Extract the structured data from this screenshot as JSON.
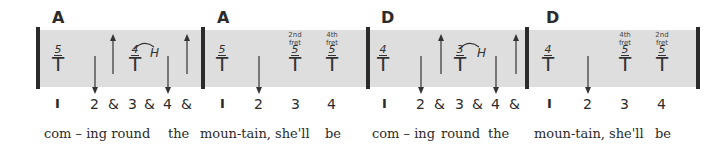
{
  "measures": [
    {
      "chord": "A",
      "notes": [
        {
          "fret": "5",
          "symbol": "T"
        },
        {
          "fret": "4",
          "symbol": "T",
          "technique": "H"
        }
      ],
      "strum": [
        "down",
        "up",
        "down",
        "up"
      ],
      "counts": [
        "I",
        "2",
        "&",
        "3",
        "&",
        "4",
        "&"
      ],
      "lyrics": [
        "com – ing round",
        "the"
      ]
    },
    {
      "chord": "A",
      "notes": [
        {
          "fret": "5",
          "symbol": "T"
        },
        {
          "fret": "5",
          "symbol": "T",
          "label": [
            "2nd",
            "fret"
          ]
        },
        {
          "fret": "5",
          "symbol": "T",
          "label": [
            "4th",
            "fret"
          ]
        }
      ],
      "strum": [
        "down"
      ],
      "counts": [
        "I",
        "2",
        "3",
        "4"
      ],
      "lyrics": [
        "moun-tain, she'll",
        "be"
      ]
    },
    {
      "chord": "D",
      "notes": [
        {
          "fret": "4",
          "symbol": "T"
        },
        {
          "fret": "3",
          "symbol": "T",
          "technique": "H"
        }
      ],
      "strum": [
        "down",
        "up",
        "down",
        "up"
      ],
      "counts": [
        "I",
        "2",
        "&",
        "3",
        "&",
        "4",
        "&"
      ],
      "lyrics": [
        "com – ing",
        "round",
        "the"
      ]
    },
    {
      "chord": "D",
      "notes": [
        {
          "fret": "4",
          "symbol": "T"
        },
        {
          "fret": "5",
          "symbol": "T",
          "label": [
            "4th",
            "fret"
          ]
        },
        {
          "fret": "5",
          "symbol": "T",
          "label": [
            "2nd",
            "fret"
          ]
        }
      ],
      "strum": [
        "down"
      ],
      "counts": [
        "I",
        "2",
        "3",
        "4"
      ],
      "lyrics": [
        "moun-tain, she'll",
        "be"
      ]
    }
  ],
  "colors": {
    "band": "#dedede",
    "bar": "#2b2b2b",
    "text": "#2b2b2b"
  }
}
